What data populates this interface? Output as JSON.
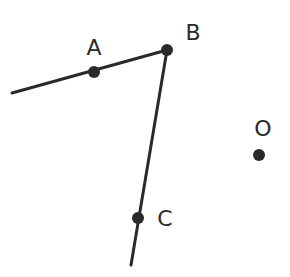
{
  "diagram": {
    "title": "",
    "stroke_color": "#2a2a2a",
    "background": "#ffffff",
    "segments": [
      {
        "name": "ray-through-A-to-B",
        "x1": 12,
        "y1": 93,
        "x2": 167,
        "y2": 50
      },
      {
        "name": "ray-from-B-through-C",
        "x1": 167,
        "y1": 50,
        "x2": 131,
        "y2": 265
      }
    ],
    "points": [
      {
        "id": "A",
        "label": "A",
        "x": 94,
        "y": 72,
        "lx": 94,
        "ly": 55,
        "filled": true
      },
      {
        "id": "B",
        "label": "B",
        "x": 167,
        "y": 50,
        "lx": 193,
        "ly": 40,
        "filled": true
      },
      {
        "id": "C",
        "label": "C",
        "x": 138,
        "y": 218,
        "lx": 165,
        "ly": 226,
        "filled": true
      },
      {
        "id": "O",
        "label": "O",
        "x": 259,
        "y": 155,
        "lx": 263,
        "ly": 136,
        "filled": true
      }
    ]
  }
}
